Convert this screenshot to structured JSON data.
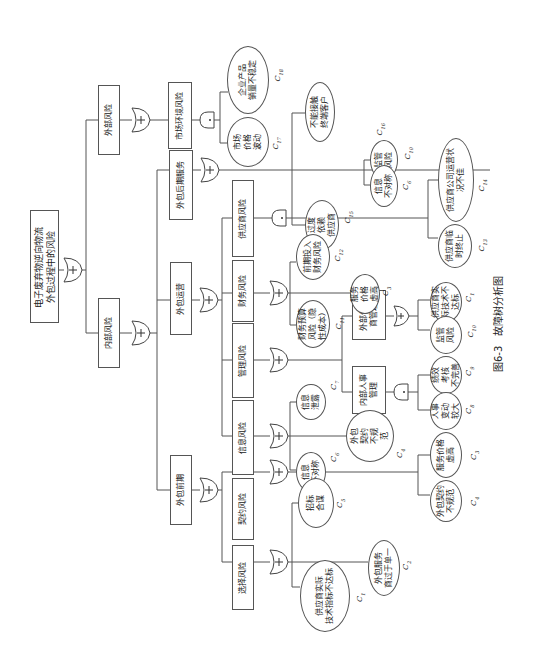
{
  "orientation": "rotated-90-ccw",
  "caption": {
    "figure_no": "图6-3",
    "title": "故障树分析图"
  },
  "top_event": {
    "label": "电子废弃物逆向物流\n外包过程中的风险",
    "gate": "OR"
  },
  "level1": {
    "external": {
      "label": "外部风险",
      "gate": "OR"
    },
    "internal": {
      "label": "内部风险",
      "gate": "OR"
    }
  },
  "external_children": {
    "market": {
      "label": "市场环境风险",
      "gate": "AND"
    }
  },
  "internal_children": {
    "after_service": {
      "label": "外包后期服务",
      "gate": "OR"
    },
    "operation": {
      "label": "外包运营",
      "gate": "OR"
    },
    "pre_stage": {
      "label": "外包前期",
      "gate": "OR"
    }
  },
  "operation_children": {
    "supplier": {
      "label": "供应商风险",
      "gate": "AND"
    },
    "finance": {
      "label": "财务风险",
      "gate": "OR"
    },
    "management": {
      "label": "管理风险",
      "gate": "OR"
    },
    "information": {
      "label": "信息风险",
      "gate": "OR"
    }
  },
  "pre_children": {
    "contract": {
      "label": "契约风险",
      "gate": "OR"
    },
    "selection": {
      "label": "选择风险",
      "gate": "OR"
    }
  },
  "management_children": {
    "external_supplier_mgmt": {
      "label": "外部供应\n商管理",
      "gate": "OR"
    },
    "internal_hr_mgmt": {
      "label": "内部人事\n管理",
      "gate": "AND"
    }
  },
  "basic_events": {
    "c18": {
      "label": "企业产品\n销量不稳定",
      "code": "C",
      "sub": "18"
    },
    "c17": {
      "label": "市场\n价格\n波动",
      "code": "C",
      "sub": "17"
    },
    "c16_cust": {
      "label": "不能接触\n终端客户",
      "code": "C",
      "sub": "16"
    },
    "c15": {
      "label": "过度\n依赖\n供应商",
      "code": "C",
      "sub": "15"
    },
    "c10_a": {
      "label": "监管\n风险",
      "code": "C",
      "sub": "10"
    },
    "c6_a": {
      "label": "信息\n不对称",
      "code": "C",
      "sub": "6"
    },
    "c14": {
      "label": "供应商公司运营状\n况不佳",
      "code": "C",
      "sub": "14"
    },
    "c13": {
      "label": "供应商临\n时终止",
      "code": "C",
      "sub": "13"
    },
    "c12": {
      "label": "前期投入\n财务风险",
      "code": "C",
      "sub": "12"
    },
    "c3": {
      "label": "服务\n价格\n虚高",
      "code": "C",
      "sub": "3"
    },
    "c11": {
      "label": "财务预算\n风险（隐\n性成本）",
      "code": "C",
      "sub": "11"
    },
    "c1_b": {
      "label": "供应商实\n际技术不\n达标",
      "code": "C",
      "sub": "1"
    },
    "c10_b": {
      "label": "监管\n风险",
      "code": "C",
      "sub": "10"
    },
    "c9": {
      "label": "绩效\n考核\n不完善",
      "code": "C",
      "sub": "9"
    },
    "c8": {
      "label": "人事\n变动\n较大",
      "code": "C",
      "sub": "8"
    },
    "c7": {
      "label": "信息\n泄露",
      "code": "C",
      "sub": "7"
    },
    "c4_a": {
      "label": "外包\n契约\n不规\n范",
      "code": "C",
      "sub": "4"
    },
    "c6_b": {
      "label": "信息\n不对称",
      "code": "C",
      "sub": "6"
    },
    "c3_b": {
      "label": "服务价格\n虚高",
      "code": "C",
      "sub": "3"
    },
    "c4_b": {
      "label": "外包契约\n不规范",
      "code": "C",
      "sub": "4"
    },
    "c5": {
      "label": "招标\n合谋",
      "code": "C",
      "sub": "5"
    },
    "c2": {
      "label": "外包服务\n商过于单一",
      "code": "C",
      "sub": "2"
    },
    "c1": {
      "label": "供应商实际\n技术指标不达标",
      "code": "C",
      "sub": "1"
    }
  },
  "gate_symbols": {
    "OR": "+",
    "AND": "·"
  }
}
